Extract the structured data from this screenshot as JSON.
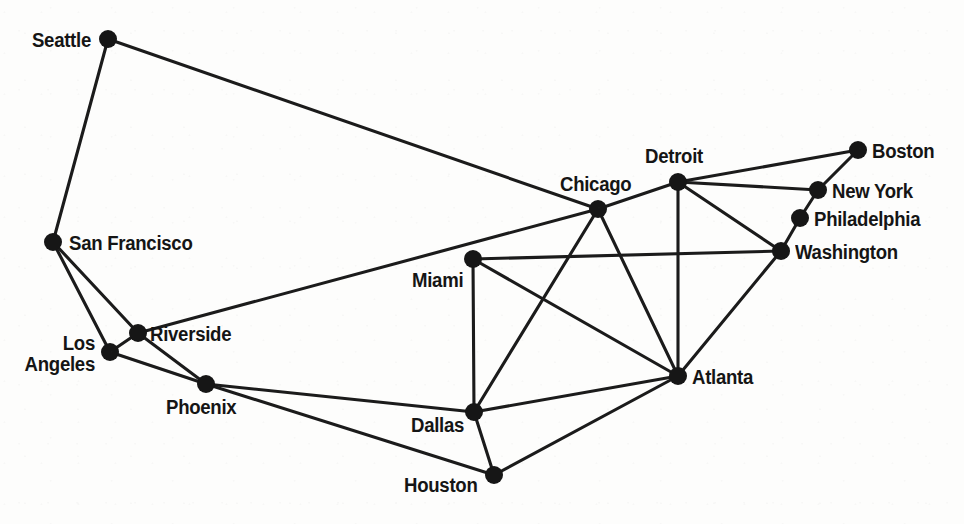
{
  "diagram": {
    "type": "node-link-graph",
    "width": 964,
    "height": 524,
    "background_color": "#fdfdfc",
    "edge_color": "#1b1b1b",
    "node_color": "#161616",
    "label_color": "#151515",
    "node_radius": 9,
    "edge_width": 3.1
  },
  "nodes": [
    {
      "id": "seattle",
      "label": "Seattle",
      "x": 108,
      "y": 39,
      "label_x": 91,
      "label_y": 30,
      "anchor": "right",
      "lines": [
        "Seattle"
      ]
    },
    {
      "id": "san_francisco",
      "label": "San Francisco",
      "x": 53,
      "y": 242,
      "label_x": 69,
      "label_y": 233,
      "anchor": "left",
      "lines": [
        "San Francisco"
      ]
    },
    {
      "id": "los_angeles",
      "label": "Los Angeles",
      "x": 110,
      "y": 352,
      "label_x": 95,
      "label_y": 333,
      "anchor": "right",
      "lines": [
        "Los",
        "Angeles"
      ]
    },
    {
      "id": "riverside",
      "label": "Riverside",
      "x": 138,
      "y": 333,
      "label_x": 150,
      "label_y": 324,
      "anchor": "left",
      "lines": [
        "Riverside"
      ]
    },
    {
      "id": "phoenix",
      "label": "Phoenix",
      "x": 206,
      "y": 384,
      "label_x": 166,
      "label_y": 397,
      "anchor": "left",
      "lines": [
        "Phoenix"
      ]
    },
    {
      "id": "dallas",
      "label": "Dallas",
      "x": 474,
      "y": 412,
      "label_x": 411,
      "label_y": 415,
      "anchor": "left",
      "lines": [
        "Dallas"
      ]
    },
    {
      "id": "houston",
      "label": "Houston",
      "x": 494,
      "y": 475,
      "label_x": 404,
      "label_y": 475,
      "anchor": "left",
      "lines": [
        "Houston"
      ]
    },
    {
      "id": "miami",
      "label": "Miami",
      "x": 473,
      "y": 259,
      "label_x": 412,
      "label_y": 270,
      "anchor": "left",
      "lines": [
        "Miami"
      ]
    },
    {
      "id": "chicago",
      "label": "Chicago",
      "x": 598,
      "y": 209,
      "label_x": 560,
      "label_y": 174,
      "anchor": "left",
      "lines": [
        "Chicago"
      ]
    },
    {
      "id": "detroit",
      "label": "Detroit",
      "x": 678,
      "y": 182,
      "label_x": 645,
      "label_y": 146,
      "anchor": "left",
      "lines": [
        "Detroit"
      ]
    },
    {
      "id": "atlanta",
      "label": "Atlanta",
      "x": 678,
      "y": 376,
      "label_x": 692,
      "label_y": 367,
      "anchor": "left",
      "lines": [
        "Atlanta"
      ]
    },
    {
      "id": "washington",
      "label": "Washington",
      "x": 781,
      "y": 251,
      "label_x": 795,
      "label_y": 242,
      "anchor": "left",
      "lines": [
        "Washington"
      ]
    },
    {
      "id": "philadelphia",
      "label": "Philadelphia",
      "x": 800,
      "y": 218,
      "label_x": 814,
      "label_y": 209,
      "anchor": "left",
      "lines": [
        "Philadelphia"
      ]
    },
    {
      "id": "new_york",
      "label": "New York",
      "x": 818,
      "y": 190,
      "label_x": 832,
      "label_y": 181,
      "anchor": "left",
      "lines": [
        "New York"
      ]
    },
    {
      "id": "boston",
      "label": "Boston",
      "x": 858,
      "y": 150,
      "label_x": 872,
      "label_y": 141,
      "anchor": "left",
      "lines": [
        "Boston"
      ]
    }
  ],
  "edges": [
    {
      "from": "seattle",
      "to": "san_francisco"
    },
    {
      "from": "seattle",
      "to": "chicago"
    },
    {
      "from": "san_francisco",
      "to": "los_angeles"
    },
    {
      "from": "san_francisco",
      "to": "riverside"
    },
    {
      "from": "los_angeles",
      "to": "riverside"
    },
    {
      "from": "los_angeles",
      "to": "phoenix"
    },
    {
      "from": "riverside",
      "to": "phoenix"
    },
    {
      "from": "riverside",
      "to": "chicago"
    },
    {
      "from": "phoenix",
      "to": "dallas"
    },
    {
      "from": "phoenix",
      "to": "houston"
    },
    {
      "from": "dallas",
      "to": "houston"
    },
    {
      "from": "dallas",
      "to": "miami"
    },
    {
      "from": "dallas",
      "to": "chicago"
    },
    {
      "from": "dallas",
      "to": "atlanta"
    },
    {
      "from": "houston",
      "to": "atlanta"
    },
    {
      "from": "miami",
      "to": "atlanta"
    },
    {
      "from": "miami",
      "to": "washington"
    },
    {
      "from": "chicago",
      "to": "detroit"
    },
    {
      "from": "chicago",
      "to": "atlanta"
    },
    {
      "from": "detroit",
      "to": "atlanta"
    },
    {
      "from": "detroit",
      "to": "washington"
    },
    {
      "from": "detroit",
      "to": "new_york"
    },
    {
      "from": "detroit",
      "to": "boston"
    },
    {
      "from": "atlanta",
      "to": "washington"
    },
    {
      "from": "washington",
      "to": "philadelphia"
    },
    {
      "from": "philadelphia",
      "to": "new_york"
    },
    {
      "from": "new_york",
      "to": "boston"
    }
  ]
}
